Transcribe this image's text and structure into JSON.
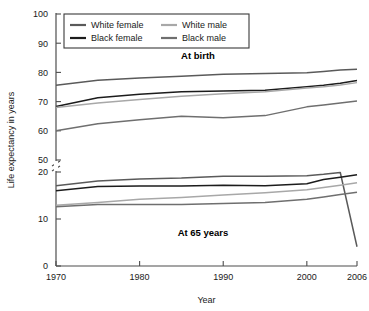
{
  "chart_data": {
    "type": "line",
    "title": "",
    "xlabel": "Year",
    "ylabel": "Life expectancy in years",
    "xlim": [
      1970,
      2006
    ],
    "ylim": [
      0,
      100
    ],
    "y_axis_break": {
      "between": [
        20,
        50
      ],
      "label": "axis-break"
    },
    "grid": false,
    "legend_position": "top-left-inside",
    "xticks": [
      "1970",
      "1980",
      "1990",
      "2000",
      "2006"
    ],
    "xtick_values": [
      1970,
      1980,
      1990,
      2000,
      2006
    ],
    "yticks": [
      "0",
      "10",
      "20",
      "50",
      "60",
      "70",
      "80",
      "90",
      "100"
    ],
    "ytick_values": [
      0,
      10,
      20,
      50,
      60,
      70,
      80,
      90,
      100
    ],
    "panel_labels": [
      "At birth",
      "At 65 years"
    ],
    "legend_entries": [
      {
        "label": "White female",
        "color": "#5a5a5a"
      },
      {
        "label": "Black female",
        "color": "#1c1c1c"
      },
      {
        "label": "White male",
        "color": "#a8a8a8"
      },
      {
        "label": "Black male",
        "color": "#6f6f6f"
      }
    ],
    "x": [
      1970,
      1975,
      1980,
      1985,
      1990,
      1995,
      2000,
      2002,
      2004,
      2006
    ],
    "panels": [
      {
        "name": "At birth",
        "series": [
          {
            "name": "White female",
            "color": "#5a5a5a",
            "values": [
              75.6,
              77.3,
              78.1,
              78.7,
              79.4,
              79.6,
              79.9,
              80.3,
              80.8,
              81.1
            ]
          },
          {
            "name": "Black female",
            "color": "#1c1c1c",
            "values": [
              68.3,
              71.3,
              72.5,
              73.4,
              73.6,
              73.9,
              75.1,
              75.6,
              76.3,
              77.2
            ]
          },
          {
            "name": "White male",
            "color": "#a8a8a8",
            "values": [
              68.0,
              69.5,
              70.7,
              71.8,
              72.7,
              73.4,
              74.7,
              75.1,
              75.7,
              76.5
            ]
          },
          {
            "name": "Black male",
            "color": "#6f6f6f",
            "values": [
              60.0,
              62.4,
              63.8,
              65.0,
              64.5,
              65.2,
              68.2,
              68.8,
              69.5,
              70.2
            ]
          }
        ]
      },
      {
        "name": "At 65 years",
        "series": [
          {
            "name": "White female",
            "color": "#5a5a5a",
            "values": [
              17.1,
              18.1,
              18.5,
              18.7,
              19.1,
              19.1,
              19.2,
              19.5,
              19.9,
              20.3
            ]
          },
          {
            "name": "Black female",
            "color": "#1c1c1c",
            "values": [
              16.0,
              16.9,
              17.0,
              17.0,
              17.2,
              17.1,
              17.5,
              18.4,
              18.9,
              19.4
            ]
          },
          {
            "name": "White male",
            "color": "#a8a8a8",
            "values": [
              12.9,
              13.5,
              14.2,
              14.6,
              15.1,
              15.6,
              16.2,
              16.7,
              17.2,
              17.7
            ]
          },
          {
            "name": "Black male",
            "color": "#6f6f6f",
            "values": [
              12.6,
              13.1,
              13.1,
              13.1,
              13.3,
              13.5,
              14.2,
              14.7,
              15.2,
              15.7
            ]
          }
        ]
      }
    ]
  }
}
